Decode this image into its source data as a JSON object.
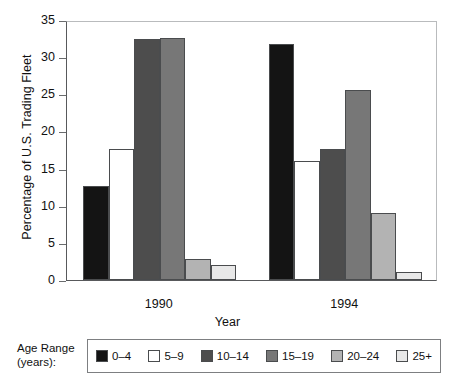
{
  "chart_data": {
    "type": "bar",
    "title": "",
    "xlabel": "Year",
    "ylabel": "Percentage of U.S. Trading Fleet",
    "categories": [
      "1990",
      "1994"
    ],
    "ylim": [
      0,
      35
    ],
    "yticks": [
      0,
      5,
      10,
      15,
      20,
      25,
      30,
      35
    ],
    "ytick_labels": [
      "0",
      "5",
      "10",
      "15",
      "20",
      "25",
      "30",
      "35"
    ],
    "grid": false,
    "legend_position": "bottom",
    "legend_title": [
      "Age Range",
      "(years):"
    ],
    "series": [
      {
        "name": "0–4",
        "color": "#141414",
        "values": [
          12.7,
          31.8
        ]
      },
      {
        "name": "5–9",
        "color": "#ffffff",
        "values": [
          17.6,
          16.0
        ]
      },
      {
        "name": "10–14",
        "color": "#4d4d4d",
        "values": [
          32.4,
          17.6
        ]
      },
      {
        "name": "15–19",
        "color": "#777777",
        "values": [
          32.6,
          25.6
        ]
      },
      {
        "name": "20–24",
        "color": "#b3b3b3",
        "values": [
          2.8,
          9.0
        ]
      },
      {
        "name": "25+",
        "color": "#e8e8e8",
        "values": [
          2.0,
          1.1
        ]
      }
    ]
  },
  "legend": {
    "title_line1": "Age Range",
    "title_line2": "(years):",
    "items": [
      {
        "label": "0–4",
        "color": "#141414"
      },
      {
        "label": "5–9",
        "color": "#ffffff"
      },
      {
        "label": "10–14",
        "color": "#4d4d4d"
      },
      {
        "label": "15–19",
        "color": "#777777"
      },
      {
        "label": "20–24",
        "color": "#b3b3b3"
      },
      {
        "label": "25+",
        "color": "#e8e8e8"
      }
    ]
  }
}
